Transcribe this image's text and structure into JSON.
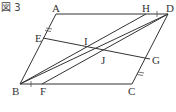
{
  "figure": {
    "title": "図 3",
    "shape": "parallelogram ABCD",
    "points": {
      "A": "A",
      "B": "B",
      "C": "C",
      "D": "D",
      "E": "E",
      "F": "F",
      "G": "G",
      "H": "H",
      "I": "I",
      "J": "J"
    },
    "segments": [
      "AD",
      "BC",
      "AB",
      "DC",
      "BH",
      "BD",
      "FD",
      "EG"
    ],
    "equal_marks": [
      {
        "segment": "AE",
        "mark": "double-tick"
      },
      {
        "segment": "CG",
        "mark": "double-tick"
      },
      {
        "segment": "HD",
        "mark": "single-tick"
      },
      {
        "segment": "BF",
        "mark": "single-tick"
      }
    ]
  }
}
